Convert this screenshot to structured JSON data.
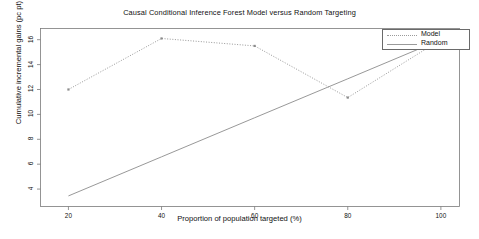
{
  "chart_data": {
    "type": "line",
    "title": "Causal Conditional Inference Forest Model versus Random Targeting",
    "xlabel": "Proportion of population targeted (%)",
    "ylabel": "Cumulative incremental gains (pc pt)",
    "x": [
      20,
      40,
      60,
      80,
      100
    ],
    "xticks": [
      "20",
      "40",
      "60",
      "80",
      "100"
    ],
    "yticks": [
      "4",
      "6",
      "8",
      "10",
      "12",
      "14",
      "16"
    ],
    "xlim": [
      14,
      104
    ],
    "ylim": [
      2.6,
      16.9
    ],
    "grid": false,
    "legend_position": "top-right",
    "series": [
      {
        "name": "Model",
        "style": "dotted",
        "markers": true,
        "color": "#8c8c8c",
        "values": [
          12.0,
          16.1,
          15.5,
          11.35,
          16.0
        ]
      },
      {
        "name": "Random",
        "style": "solid",
        "markers": false,
        "color": "#8c8c8c",
        "values": [
          3.45,
          6.59,
          9.73,
          12.86,
          16.0
        ]
      }
    ]
  },
  "legend": {
    "items": [
      {
        "label": "Model",
        "style": "dotted"
      },
      {
        "label": "Random",
        "style": "solid"
      }
    ]
  }
}
